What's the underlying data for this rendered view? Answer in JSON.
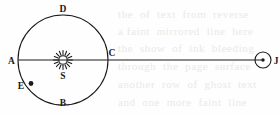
{
  "figure": {
    "name": "orbit-diagram",
    "background_color": "#fefefe",
    "ink_color": "#1a1a1a",
    "width": 279,
    "height": 116
  },
  "orbit": {
    "name": "orbit-circle",
    "center_x": 63,
    "center_y": 60,
    "radius": 45,
    "stroke_width": 1.1
  },
  "axis_line": {
    "name": "horizontal-axis-line",
    "x1": 18,
    "x2": 263,
    "y": 60,
    "stroke_width": 1.2
  },
  "sun": {
    "name": "sun-symbol",
    "label": "S",
    "center_x": 63,
    "center_y": 60,
    "core_radius": 4.2,
    "ray_count": 16,
    "ray_inner": 5.2,
    "ray_outer": 9.4,
    "label_x": 63,
    "label_y": 79
  },
  "planet_j": {
    "name": "planet-j",
    "label": "J",
    "center_x": 263,
    "center_y": 60,
    "radius": 8,
    "dot_radius": 1.7,
    "label_x": 276,
    "label_y": 63.5
  },
  "point_e": {
    "name": "point-e-marker",
    "label": "E",
    "dot_x": 31,
    "dot_y": 83.5,
    "dot_radius": 2.4,
    "label_x": 21,
    "label_y": 89
  },
  "labels": [
    {
      "id": "label-a",
      "text": "A",
      "x": 11.5,
      "y": 63.5,
      "anchor": "middle"
    },
    {
      "id": "label-b",
      "text": "B",
      "x": 63,
      "y": 106,
      "anchor": "middle"
    },
    {
      "id": "label-c",
      "text": "C",
      "x": 112,
      "y": 56,
      "anchor": "middle"
    },
    {
      "id": "label-d",
      "text": "D",
      "x": 63,
      "y": 12,
      "anchor": "middle"
    }
  ],
  "ghost_text": {
    "name": "scanner-bleed-through-text",
    "lines": [
      "the  of  text  from  reverse",
      "a faint  mirrored  line  here",
      "the  show  of  ink  bleeding",
      "through  the  page  surface",
      "another  row  of  ghost  text",
      "and  one  more  faint  line"
    ]
  }
}
